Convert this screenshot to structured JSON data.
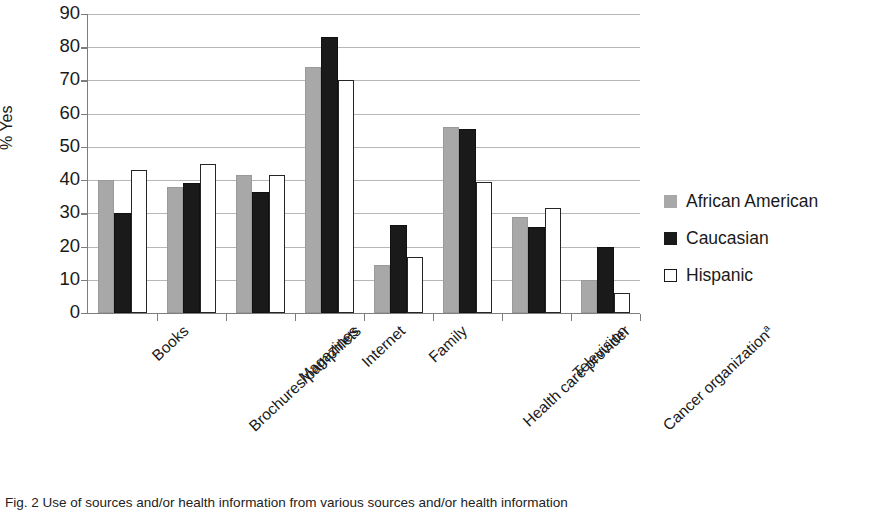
{
  "chart_data": {
    "type": "bar",
    "title": "",
    "xlabel": "",
    "ylabel": "% Yes",
    "ylim": [
      0,
      90
    ],
    "ytick_step": 10,
    "yticks": [
      0,
      10,
      20,
      30,
      40,
      50,
      60,
      70,
      80,
      90
    ],
    "grid": "horizontal",
    "legend_position": "right",
    "categories": [
      "Books",
      "Brochures/pamphlets",
      "Magazines",
      "Internet",
      "Family",
      "Health care provider",
      "Television",
      "Cancer organization"
    ],
    "category_footnote_markers": [
      "",
      "",
      "",
      "",
      "",
      "",
      "",
      "a"
    ],
    "series": [
      {
        "name": "African American",
        "color": "#a8a8a8",
        "values": [
          40,
          38,
          41.5,
          74,
          14.5,
          56,
          29,
          10
        ]
      },
      {
        "name": "Caucasian",
        "color": "#1a1a1a",
        "values": [
          30,
          39,
          36.5,
          83,
          26.5,
          55.5,
          26,
          20
        ]
      },
      {
        "name": "Hispanic",
        "color": "#ffffff",
        "values": [
          43,
          45,
          41.5,
          70,
          17,
          39.5,
          31.5,
          6
        ]
      }
    ]
  },
  "legend": {
    "items": [
      {
        "label": "African American",
        "swatch": "gray-filled-square"
      },
      {
        "label": "Caucasian",
        "swatch": "black-filled-square"
      },
      {
        "label": "Hispanic",
        "swatch": "white-outlined-square"
      }
    ]
  },
  "caption": {
    "figure_number": "Fig. 2",
    "text": "Fig. 2  Use of sources and/or health information from various sources and/or health information"
  }
}
